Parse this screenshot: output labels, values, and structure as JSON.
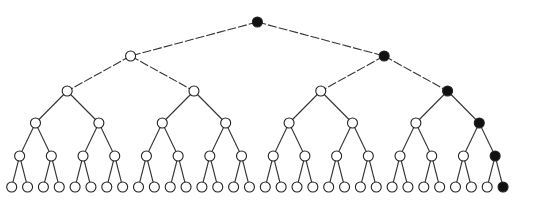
{
  "diagram": {
    "type": "complete-binary-tree",
    "depth": 5,
    "leaf_count": 32,
    "levels_y": [
      22,
      56,
      91,
      123,
      156,
      187
    ],
    "leaf_x_start": 11.7,
    "leaf_spacing": 15.85,
    "node_radius": 5,
    "highlighted_path": [
      "root",
      "R",
      "R",
      "R",
      "R",
      "R"
    ],
    "colors": {
      "edge": "#333333",
      "node_stroke": "#222222",
      "node_fill": "#ffffff",
      "highlight_fill": "#111111"
    },
    "edge_style": {
      "top_levels": "dashed",
      "lower_levels": "solid"
    }
  }
}
